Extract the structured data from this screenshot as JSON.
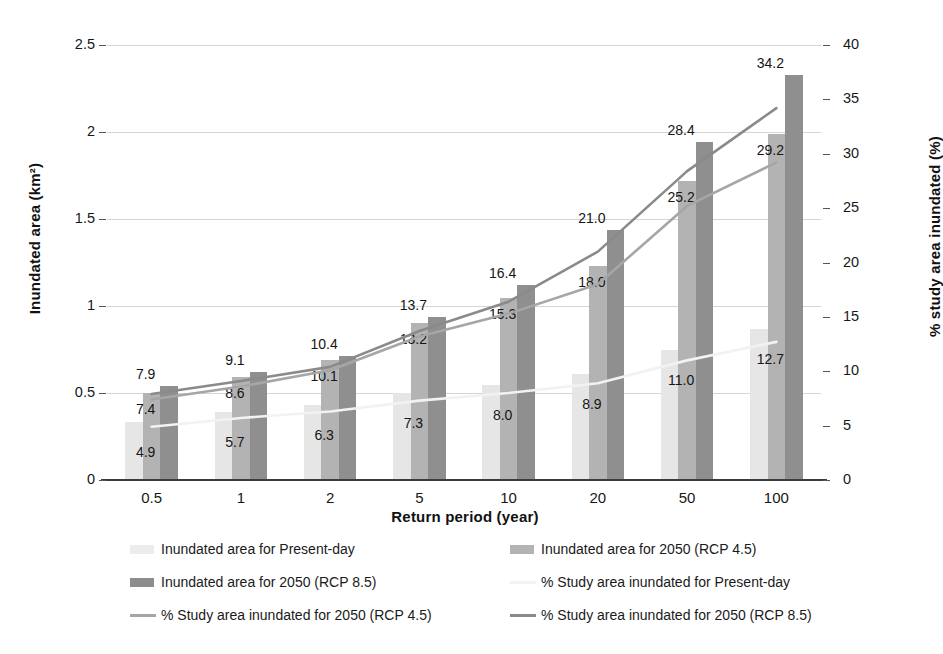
{
  "chart_data": {
    "type": "bar",
    "title": "",
    "xlabel": "Return period (year)",
    "ylabel": "Inundated area (km²)",
    "ylabel_secondary": "% study area inundated (%)",
    "categories": [
      "0.5",
      "1",
      "2",
      "5",
      "10",
      "20",
      "50",
      "100"
    ],
    "ylim": [
      0,
      2.5
    ],
    "yticks": [
      "0",
      "0.5",
      "1",
      "1.5",
      "2",
      "2.5"
    ],
    "ylim_secondary": [
      0,
      40
    ],
    "yticks_secondary": [
      "0",
      "5",
      "10",
      "15",
      "20",
      "25",
      "30",
      "35",
      "40"
    ],
    "grid": true,
    "legend_position": "bottom",
    "series": [
      {
        "name": "Inundated area for Present-day",
        "kind": "bar",
        "axis": "left",
        "color": "#e6e6e6",
        "values": [
          0.335,
          0.39,
          0.43,
          0.5,
          0.545,
          0.61,
          0.75,
          0.87
        ]
      },
      {
        "name": "Inundated area for 2050 (RCP 4.5)",
        "kind": "bar",
        "axis": "left",
        "color": "#b3b3b3",
        "values": [
          0.5,
          0.59,
          0.69,
          0.9,
          1.045,
          1.23,
          1.72,
          1.99
        ]
      },
      {
        "name": "Inundated area for 2050 (RCP 8.5)",
        "kind": "bar",
        "axis": "left",
        "color": "#8f8f8f",
        "values": [
          0.54,
          0.62,
          0.71,
          0.935,
          1.12,
          1.435,
          1.94,
          2.33
        ]
      },
      {
        "name": "% Study area inundated for Present-day",
        "kind": "line",
        "axis": "right",
        "color": "#f2f2f2",
        "values": [
          4.9,
          5.7,
          6.3,
          7.3,
          8.0,
          8.9,
          11.0,
          12.7
        ]
      },
      {
        "name": "% Study area inundated for 2050 (RCP 4.5)",
        "kind": "line",
        "axis": "right",
        "color": "#a6a6a6",
        "values": [
          7.4,
          8.6,
          10.1,
          13.2,
          15.3,
          18.0,
          25.2,
          29.2
        ]
      },
      {
        "name": "% Study area inundated for 2050 (RCP 8.5)",
        "kind": "line",
        "axis": "right",
        "color": "#8a8a8a",
        "values": [
          7.9,
          9.1,
          10.4,
          13.7,
          16.4,
          21.0,
          28.4,
          34.2
        ]
      }
    ],
    "data_labels": {
      "present_day": [
        "4.9",
        "5.7",
        "6.3",
        "7.3",
        "8.0",
        "8.9",
        "11.0",
        "12.7"
      ],
      "rcp45": [
        "7.4",
        "8.6",
        "10.1",
        "13.2",
        "15.3",
        "18.0",
        "25.2",
        "29.2"
      ],
      "rcp85": [
        "7.9",
        "9.1",
        "10.4",
        "13.7",
        "16.4",
        "21.0",
        "28.4",
        "34.2"
      ]
    }
  },
  "legend": {
    "items": [
      {
        "label": "Inundated area for Present-day",
        "marker": "swatch",
        "style": "s0"
      },
      {
        "label": "Inundated area for 2050 (RCP 4.5)",
        "marker": "swatch",
        "style": "s1"
      },
      {
        "label": "Inundated area for 2050 (RCP 8.5)",
        "marker": "swatch",
        "style": "s2"
      },
      {
        "label": "% Study area inundated for Present-day",
        "marker": "line",
        "style": "l0"
      },
      {
        "label": "% Study area inundated for 2050 (RCP 4.5)",
        "marker": "line",
        "style": "l1"
      },
      {
        "label": "% Study area inundated for 2050 (RCP 8.5)",
        "marker": "line",
        "style": "l2"
      }
    ]
  },
  "colors": {
    "bar_present": "#e6e6e6",
    "bar_rcp45": "#b3b3b3",
    "bar_rcp85": "#8f8f8f",
    "line_present": "#f2f2f2",
    "line_rcp45": "#a6a6a6",
    "line_rcp85": "#8a8a8a",
    "grid": "#d5d5d5",
    "axis": "#3c3c3c"
  }
}
